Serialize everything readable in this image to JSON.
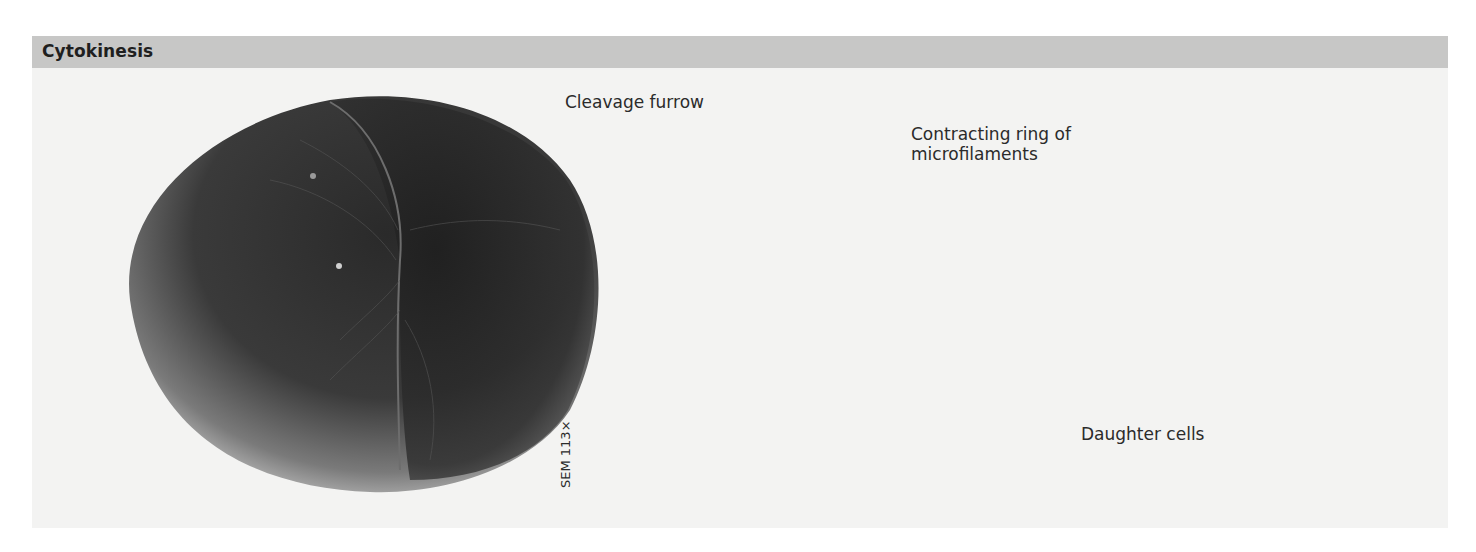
{
  "figure": {
    "title": "Cytokinesis",
    "colors": {
      "header_band": "#c7c7c6",
      "panel_background": "#f3f3f2",
      "cell_fill": "#c9c9c8",
      "arrow_gray": "#8a8a8a",
      "leader_line": "#222222"
    }
  },
  "labels": {
    "cleavage_furrow": "Cleavage furrow",
    "contracting_ring_line1": "Contracting ring of",
    "contracting_ring_line2": "microfilaments",
    "daughter_cells": "Daughter cells",
    "micrograph_scale": "SEM 113×"
  },
  "panels": [
    {
      "id": "sem-micrograph",
      "description": "Scanning electron micrograph of a dividing cell showing the cleavage furrow"
    },
    {
      "id": "dividing-cell",
      "description": "Cell pinching in two with contracting ring of microfilaments; gray arrows point inward"
    },
    {
      "id": "daughter-cells",
      "description": "Two separate daughter cells, each with a nucleus"
    }
  ]
}
